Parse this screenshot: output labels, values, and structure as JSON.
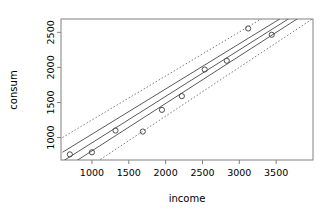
{
  "chart_data": {
    "type": "scatter",
    "title": "",
    "subtitle": "",
    "xlabel": "income",
    "ylabel": "consum",
    "xlim": [
      580,
      4000
    ],
    "ylim": [
      680,
      2690
    ],
    "xticks": [
      1000,
      1500,
      2000,
      2500,
      3000,
      3500
    ],
    "yticks": [
      1000,
      1500,
      2000,
      2500
    ],
    "xtick_labels": [
      "1000",
      "1500",
      "2000",
      "2500",
      "3000",
      "3500"
    ],
    "ytick_labels": [
      "1000",
      "1500",
      "2000",
      "2500"
    ],
    "grid": false,
    "legend": "none",
    "point_marker": "open-circle",
    "points": [
      {
        "x": 700,
        "y": 760
      },
      {
        "x": 1000,
        "y": 790
      },
      {
        "x": 1320,
        "y": 1100
      },
      {
        "x": 1690,
        "y": 1085
      },
      {
        "x": 1950,
        "y": 1395
      },
      {
        "x": 2220,
        "y": 1590
      },
      {
        "x": 2530,
        "y": 1970
      },
      {
        "x": 2830,
        "y": 2095
      },
      {
        "x": 3120,
        "y": 2555
      },
      {
        "x": 3440,
        "y": 2465
      }
    ],
    "series": [
      {
        "name": "fitted regression line",
        "style": "solid",
        "x": [
          600,
          3990
        ],
        "y": [
          660,
          2905
        ]
      },
      {
        "name": "confidence band upper",
        "style": "solid",
        "x": [
          600,
          3990
        ],
        "y": [
          790,
          2975
        ]
      },
      {
        "name": "confidence band lower",
        "style": "solid",
        "x": [
          600,
          3990
        ],
        "y": [
          540,
          2830
        ]
      },
      {
        "name": "prediction interval upper",
        "style": "dotted",
        "x": [
          600,
          3990
        ],
        "y": [
          1000,
          3125
        ]
      },
      {
        "name": "prediction interval lower",
        "style": "dotted",
        "x": [
          600,
          3990
        ],
        "y": [
          330,
          2690
        ]
      }
    ],
    "regression": {
      "slope": 0.662,
      "intercept": 263
    },
    "axis_color": "#808080",
    "line_color": "#595959",
    "point_color": "#4d4d4d",
    "text_color": "#000000"
  }
}
